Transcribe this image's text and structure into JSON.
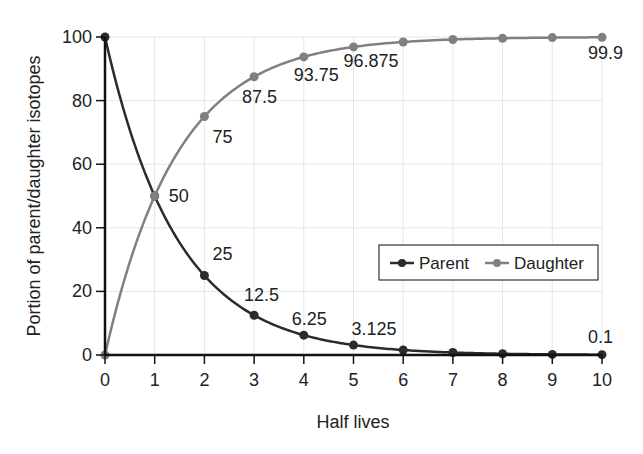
{
  "chart_data": {
    "type": "line",
    "title": "",
    "xlabel": "Half lives",
    "ylabel": "Portion of parent/daughter isotopes",
    "x": [
      0,
      1,
      2,
      3,
      4,
      5,
      6,
      7,
      8,
      9,
      10
    ],
    "xlim": [
      0,
      10
    ],
    "ylim": [
      0,
      100
    ],
    "xticks": [
      "0",
      "1",
      "2",
      "3",
      "4",
      "5",
      "6",
      "7",
      "8",
      "9",
      "10"
    ],
    "yticks": [
      "0",
      "20",
      "40",
      "60",
      "80",
      "100"
    ],
    "grid": true,
    "legend_position": "lower right (inside plot)",
    "series": [
      {
        "name": "Parent",
        "color": "#2b2b2b",
        "values": [
          100,
          50,
          25,
          12.5,
          6.25,
          3.125,
          1.5625,
          0.78125,
          0.390625,
          0.1953125,
          0.1
        ]
      },
      {
        "name": "Daughter",
        "color": "#808080",
        "values": [
          0,
          50,
          75,
          87.5,
          93.75,
          96.875,
          98.4375,
          99.21875,
          99.609375,
          99.8046875,
          99.9
        ]
      }
    ],
    "annotations": [
      {
        "text": "50",
        "x": 1,
        "y": 50
      },
      {
        "text": "75",
        "x": 2,
        "y": 75
      },
      {
        "text": "87.5",
        "x": 3,
        "y": 87.5
      },
      {
        "text": "93.75",
        "x": 4,
        "y": 93.75
      },
      {
        "text": "96.875",
        "x": 5,
        "y": 96.875
      },
      {
        "text": "99.9",
        "x": 10,
        "y": 99.9
      },
      {
        "text": "25",
        "x": 2,
        "y": 25
      },
      {
        "text": "12.5",
        "x": 3,
        "y": 12.5
      },
      {
        "text": "6.25",
        "x": 4,
        "y": 6.25
      },
      {
        "text": "3.125",
        "x": 5,
        "y": 3.125
      },
      {
        "text": "0.1",
        "x": 10,
        "y": 0.1
      }
    ]
  },
  "legend": {
    "parent_label": "Parent",
    "daughter_label": "Daughter"
  },
  "axes": {
    "xlabel": "Half lives",
    "ylabel": "Portion of parent/daughter isotopes"
  }
}
